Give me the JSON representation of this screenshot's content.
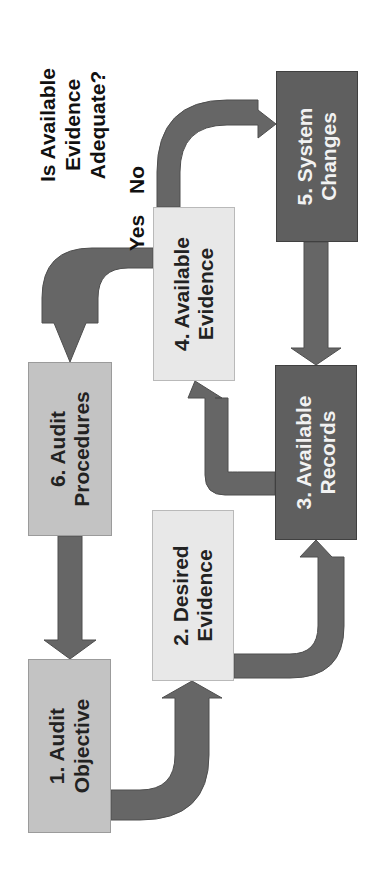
{
  "diagram": {
    "type": "flowchart",
    "orientation": "rotated 90deg counter-clockwise",
    "question": "Is Available\nEvidence\nAdequate?",
    "branch_labels": {
      "yes": "Yes",
      "no": "No"
    },
    "nodes": [
      {
        "id": "1",
        "label": "1. Audit\nObjective",
        "shade": "medium-gray"
      },
      {
        "id": "2",
        "label": "2. Desired\nEvidence",
        "shade": "light-gray"
      },
      {
        "id": "3",
        "label": "3. Available\nRecords",
        "shade": "dark-gray"
      },
      {
        "id": "4",
        "label": "4. Available\nEvidence",
        "shade": "light-gray"
      },
      {
        "id": "5",
        "label": "5. System\nChanges",
        "shade": "dark-gray"
      },
      {
        "id": "6",
        "label": "6. Audit\nProcedures",
        "shade": "medium-gray"
      }
    ],
    "edges": [
      {
        "from": "1",
        "to": "2"
      },
      {
        "from": "2",
        "to": "3"
      },
      {
        "from": "3",
        "to": "4"
      },
      {
        "from": "4",
        "to": "5",
        "label": "No"
      },
      {
        "from": "5",
        "to": "3"
      },
      {
        "from": "4",
        "to": "6",
        "label": "Yes"
      },
      {
        "from": "6",
        "to": "1"
      }
    ],
    "colors": {
      "light_box": "#e8e8e8",
      "medium_box": "#c3c3c3",
      "dark_box": "#5f5f5f",
      "arrow": "#666666",
      "background": "#ffffff"
    }
  }
}
